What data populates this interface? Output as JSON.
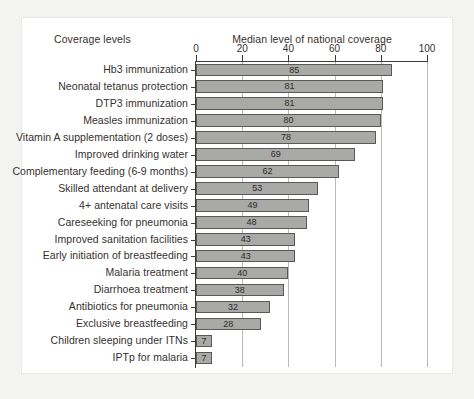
{
  "figure": {
    "corner_label": "Coverage levels",
    "axis_title": "Median level of national coverage"
  },
  "chart_data": {
    "type": "bar",
    "orientation": "horizontal",
    "title": "Median level of national coverage",
    "xlabel": "Median level of national coverage",
    "ylabel": "Coverage levels",
    "xlim": [
      0,
      100
    ],
    "ticks": [
      0,
      20,
      40,
      60,
      80,
      100
    ],
    "tick_labels": [
      "0",
      "20",
      "40",
      "60",
      "80",
      "100"
    ],
    "grid": "vertical",
    "legend": "none",
    "bar_color": "#a9a9a7",
    "bar_edge_color": "#595957",
    "categories": [
      "Hb3 immunization",
      "Neonatal tetanus protection",
      "DTP3 immunization",
      "Measles immunization",
      "Vitamin A supplementation (2 doses)",
      "Improved drinking water",
      "Complementary feeding (6-9 months)",
      "Skilled attendant at delivery",
      "4+ antenatal care visits",
      "Careseeking for pneumonia",
      "Improved sanitation facilities",
      "Early initiation of breastfeeding",
      "Malaria treatment",
      "Diarrhoea treatment",
      "Antibiotics for pneumonia",
      "Exclusive breastfeeding",
      "Children sleeping under ITNs",
      "IPTp for malaria"
    ],
    "values": [
      85,
      81,
      81,
      80,
      78,
      69,
      62,
      53,
      49,
      48,
      43,
      43,
      40,
      38,
      32,
      28,
      7,
      7
    ],
    "value_labels": [
      "85",
      "81",
      "81",
      "80",
      "78",
      "69",
      "62",
      "53",
      "49",
      "48",
      "43",
      "43",
      "40",
      "38",
      "32",
      "28",
      "7",
      "7"
    ]
  }
}
